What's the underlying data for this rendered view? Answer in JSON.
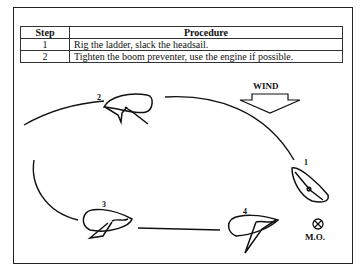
{
  "table": {
    "headers": [
      "Step",
      "Procedure"
    ],
    "rows": [
      {
        "step": "1",
        "procedure": "Rig the ladder, slack the headsail."
      },
      {
        "step": "2",
        "procedure": "Tighten the boom preventer, use the engine if possible."
      }
    ]
  },
  "diagram": {
    "wind_label": "WIND",
    "wind_icon": "down-arrow-icon",
    "positions": [
      {
        "label": "1"
      },
      {
        "label": "2"
      },
      {
        "label": "3"
      },
      {
        "label": "4"
      }
    ],
    "mob_marker": {
      "label": "M.O.",
      "icon": "crosshair-circle-icon"
    }
  }
}
